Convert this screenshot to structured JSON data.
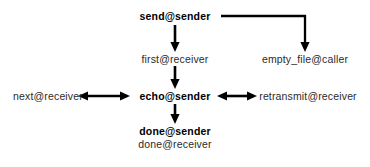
{
  "diagram": {
    "type": "flowchart",
    "background_color": "#ffffff",
    "stroke_color": "#000000",
    "nodes": [
      {
        "id": "send-sender",
        "label": "send@sender",
        "weight": "bold",
        "x": 175,
        "y": 16
      },
      {
        "id": "first-receiver",
        "label": "first@receiver",
        "weight": "regular",
        "x": 175,
        "y": 59
      },
      {
        "id": "empty-file-caller",
        "label": "empty_file@caller",
        "weight": "regular",
        "x": 305,
        "y": 59
      },
      {
        "id": "next-receiver",
        "label": "next@receiver",
        "weight": "regular",
        "x": 48,
        "y": 96
      },
      {
        "id": "echo-sender",
        "label": "echo@sender",
        "weight": "bold",
        "x": 175,
        "y": 96
      },
      {
        "id": "retransmit-receiver",
        "label": "retransmit@receiver",
        "weight": "regular",
        "x": 308,
        "y": 96
      },
      {
        "id": "done-sender",
        "label": "done@sender",
        "weight": "bold",
        "x": 175,
        "y": 132
      },
      {
        "id": "done-receiver",
        "label": "done@receiver",
        "weight": "regular",
        "x": 175,
        "y": 145
      }
    ],
    "edges": [
      {
        "id": "send-to-first",
        "from": "send@sender",
        "to": "first@receiver",
        "style": "vertical-down",
        "heads": "single"
      },
      {
        "id": "send-to-empty-file",
        "from": "send@sender",
        "to": "empty_file@caller",
        "style": "elbow-right-down",
        "heads": "single"
      },
      {
        "id": "first-to-echo",
        "from": "first@receiver",
        "to": "echo@sender",
        "style": "vertical-down",
        "heads": "single"
      },
      {
        "id": "echo-to-next",
        "from": "echo@sender",
        "to": "next@receiver",
        "style": "horizontal-left",
        "heads": "double"
      },
      {
        "id": "echo-to-retransmit",
        "from": "echo@sender",
        "to": "retransmit@receiver",
        "style": "horizontal-right",
        "heads": "double"
      },
      {
        "id": "echo-to-done",
        "from": "echo@sender",
        "to": "done@sender",
        "style": "vertical-down",
        "heads": "single"
      }
    ]
  }
}
